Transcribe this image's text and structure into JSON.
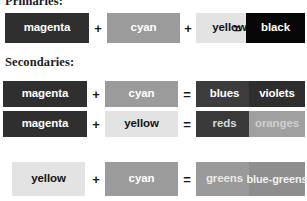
{
  "headings": {
    "primaries": "Primaries:",
    "secondaries": "Secondaries:"
  },
  "operators": {
    "plus": "+",
    "equals": "="
  },
  "palette": {
    "magenta": "#2f2f2f",
    "magenta_text": "#ffffff",
    "cyan": "#9b9b9b",
    "cyan_text": "#ffffff",
    "yellow": "#e3e3e3",
    "yellow_text": "#141414",
    "black": "#070707",
    "black_text": "#ffffff",
    "blues": "#3c3c3c",
    "blues_text": "#ffffff",
    "violets": "#2e2e2e",
    "violets_text": "#ffffff",
    "reds": "#3a3a3a",
    "reds_text": "#d9d9d9",
    "oranges": "#a0a0a0",
    "oranges_text": "#cfcfcf",
    "greens": "#9a9a9a",
    "greens_text": "#e8e8e8",
    "bluegreens": "#8e8e8e",
    "bluegreens_text": "#f0f0f0"
  },
  "primaries_row": {
    "items": [
      {
        "label": "magenta",
        "bg": "#2f2f2f",
        "fg": "#ffffff",
        "x": 5,
        "w": 84
      },
      {
        "label": "cyan",
        "bg": "#9b9b9b",
        "fg": "#ffffff",
        "x": 107,
        "w": 73
      },
      {
        "label": "yellow",
        "bg": "#e3e3e3",
        "fg": "#141414",
        "x": 196,
        "w": 67
      },
      {
        "label": "black",
        "bg": "#070707",
        "fg": "#ffffff",
        "x": 246,
        "w": 59
      }
    ],
    "ops": [
      {
        "symbol": "+",
        "x": 89,
        "w": 18
      },
      {
        "symbol": "+",
        "x": 180,
        "w": 16
      },
      {
        "symbol": "=",
        "x": 228,
        "w": 18
      }
    ]
  },
  "secondary_rows": [
    {
      "inputs": [
        {
          "label": "magenta",
          "bg": "#2f2f2f",
          "fg": "#ffffff",
          "x": 3,
          "w": 84
        },
        {
          "label": "cyan",
          "bg": "#9b9b9b",
          "fg": "#ffffff",
          "x": 105,
          "w": 73
        }
      ],
      "results": [
        {
          "label": "blues",
          "bg": "#3c3c3c",
          "fg": "#ffffff",
          "x": 196,
          "w": 57
        },
        {
          "label": "violets",
          "bg": "#2e2e2e",
          "fg": "#ffffff",
          "x": 249,
          "w": 56
        }
      ],
      "ops": [
        {
          "symbol": "+",
          "x": 87,
          "w": 18
        },
        {
          "symbol": "=",
          "x": 178,
          "w": 18
        }
      ]
    },
    {
      "inputs": [
        {
          "label": "magenta",
          "bg": "#2f2f2f",
          "fg": "#ffffff",
          "x": 3,
          "w": 84
        },
        {
          "label": "yellow",
          "bg": "#e3e3e3",
          "fg": "#141414",
          "x": 105,
          "w": 73
        }
      ],
      "results": [
        {
          "label": "reds",
          "bg": "#3a3a3a",
          "fg": "#d9d9d9",
          "x": 196,
          "w": 57
        },
        {
          "label": "oranges",
          "bg": "#a0a0a0",
          "fg": "#cfcfcf",
          "x": 249,
          "w": 56
        }
      ],
      "ops": [
        {
          "symbol": "+",
          "x": 87,
          "w": 18
        },
        {
          "symbol": "=",
          "x": 178,
          "w": 18
        }
      ]
    },
    {
      "inputs": [
        {
          "label": "yellow",
          "bg": "#e3e3e3",
          "fg": "#141414",
          "x": 12,
          "w": 73
        },
        {
          "label": "cyan",
          "bg": "#9b9b9b",
          "fg": "#ffffff",
          "x": 105,
          "w": 73
        }
      ],
      "results": [
        {
          "label": "greens",
          "bg": "#9a9a9a",
          "fg": "#e8e8e8",
          "x": 196,
          "w": 57
        },
        {
          "label": "blue-greens",
          "bg": "#8e8e8e",
          "fg": "#f0f0f0",
          "x": 249,
          "w": 56,
          "lines": [
            "blue-",
            "greens"
          ]
        }
      ],
      "ops": [
        {
          "symbol": "+",
          "x": 87,
          "w": 18
        },
        {
          "symbol": "=",
          "x": 178,
          "w": 18
        }
      ]
    }
  ]
}
